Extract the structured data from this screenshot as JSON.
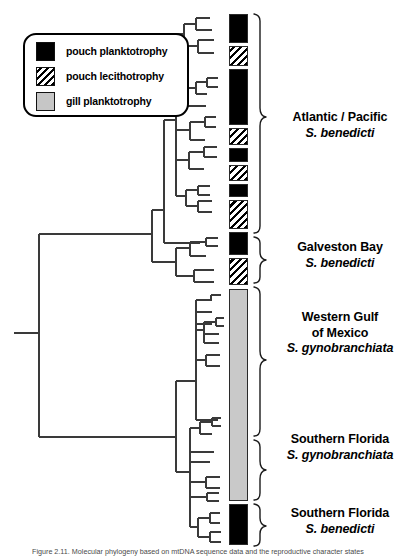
{
  "figure": {
    "caption": "Figure 2.11.  Molecular phylogeny based on mtDNA sequence data and the reproductive character states"
  },
  "legend": {
    "items": [
      {
        "swatch": "black-square-icon",
        "pattern": "solid-black",
        "label": "pouch planktotrophy",
        "color": "#000000"
      },
      {
        "swatch": "hatched-square-icon",
        "pattern": "diagonal-hatch",
        "label": "pouch lecithotrophy",
        "color": "#000000"
      },
      {
        "swatch": "gray-square-icon",
        "pattern": "solid-gray",
        "label": "gill planktotrophy",
        "color": "#c6c6c6"
      }
    ]
  },
  "groups": [
    {
      "location": "Atlantic / Pacific",
      "location2": "",
      "species": "S. benedicti"
    },
    {
      "location": "Galveston Bay",
      "location2": "",
      "species": "S. benedicti"
    },
    {
      "location": "Western Gulf",
      "location2": "of Mexico",
      "species": "S. gynobranchiata"
    },
    {
      "location": "Southern Florida",
      "location2": "",
      "species": "S. gynobranchiata"
    },
    {
      "location": "Southern Florida",
      "location2": "",
      "species": "S. benedicti"
    }
  ],
  "chart_data": {
    "type": "tree",
    "xlabel": "",
    "ylabel": "",
    "grid": false,
    "legend_position": "top-left",
    "character_states": [
      "pouch planktotrophy",
      "pouch lecithotrophy",
      "gill planktotrophy"
    ],
    "state_colors": {
      "pouch planktotrophy": "#000000",
      "pouch lecithotrophy": "#ffffff",
      "gill planktotrophy": "#c6c6c6"
    },
    "state_blocks": [
      {
        "state": "pouch planktotrophy",
        "pattern": "b-black",
        "top": 14,
        "height": 29
      },
      {
        "state": "pouch lecithotrophy",
        "pattern": "b-hatch",
        "top": 46,
        "height": 20
      },
      {
        "state": "pouch planktotrophy",
        "pattern": "b-black",
        "top": 69,
        "height": 56
      },
      {
        "state": "pouch lecithotrophy",
        "pattern": "b-hatch",
        "top": 128,
        "height": 17
      },
      {
        "state": "pouch planktotrophy",
        "pattern": "b-black",
        "top": 148,
        "height": 14
      },
      {
        "state": "pouch lecithotrophy",
        "pattern": "b-hatch",
        "top": 165,
        "height": 16
      },
      {
        "state": "pouch planktotrophy",
        "pattern": "b-black",
        "top": 184,
        "height": 13
      },
      {
        "state": "pouch lecithotrophy",
        "pattern": "b-hatch",
        "top": 200,
        "height": 29
      },
      {
        "state": "pouch planktotrophy",
        "pattern": "b-black",
        "top": 232,
        "height": 23
      },
      {
        "state": "pouch lecithotrophy",
        "pattern": "b-hatch",
        "top": 258,
        "height": 27
      },
      {
        "state": "gill planktotrophy",
        "pattern": "b-gray",
        "top": 289,
        "height": 212
      },
      {
        "state": "pouch planktotrophy",
        "pattern": "b-black",
        "top": 504,
        "height": 41
      }
    ],
    "group_brackets": [
      {
        "label": "Atlantic / Pacific S. benedicti",
        "top": 14,
        "bottom": 233
      },
      {
        "label": "Galveston Bay S. benedicti",
        "top": 237,
        "bottom": 283
      },
      {
        "label": "Western Gulf of Mexico S. gynobranchiata",
        "top": 287,
        "bottom": 436
      },
      {
        "label": "Southern Florida S. gynobranchiata",
        "top": 440,
        "bottom": 500
      },
      {
        "label": "Southern Florida S. benedicti",
        "top": 504,
        "bottom": 546
      }
    ],
    "group_label_tops": [
      105,
      240,
      310,
      430,
      500
    ],
    "n_terminal_taxa": 45,
    "root_x": 14,
    "root_y": 333
  }
}
